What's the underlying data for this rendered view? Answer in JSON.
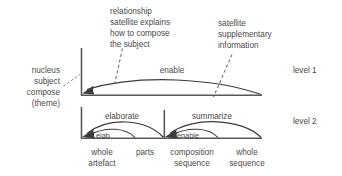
{
  "diagram": {
    "colors": {
      "background": "#ffffff",
      "stroke": "#3c3c3c",
      "axis": "#585858",
      "text": "#4a4a4a",
      "leader": "#6a6a6a"
    },
    "annotations": {
      "left_block": {
        "line1": "nucleus",
        "line2": "subject",
        "line3": "compose",
        "line4": "(theme)"
      },
      "top_left_block": {
        "line1": "relationship",
        "line2": "satellite explains",
        "line3": "how to compose",
        "line4": "the subject"
      },
      "top_right_block": {
        "line1": "satellite",
        "line2": "supplementary",
        "line3": "information"
      }
    },
    "levels": [
      {
        "id": "level-1",
        "label": "level 1"
      },
      {
        "id": "level-2",
        "label": "level 2"
      }
    ],
    "relations": {
      "level1_main": "enable",
      "level2_left_outer": "elaborate",
      "level2_right_outer": "summarize",
      "level2_left_inner": "elab",
      "level2_right_inner": "enable"
    },
    "base_labels": [
      {
        "line1": "whole",
        "line2": "artefact"
      },
      {
        "line1": "parts",
        "line2": ""
      },
      {
        "line1": "composition",
        "line2": "sequence"
      },
      {
        "line1": "whole",
        "line2": "sequence"
      }
    ]
  }
}
